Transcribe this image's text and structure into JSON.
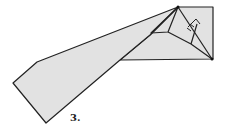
{
  "diagram": {
    "type": "origami-fold-step",
    "step_label": "3.",
    "colors": {
      "paper_fill": "#e2e2e2",
      "stroke": "#222222",
      "background": "#ffffff"
    }
  }
}
